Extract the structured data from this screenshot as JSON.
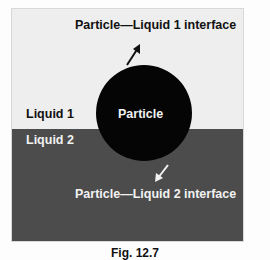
{
  "figure": {
    "colors": {
      "liquid1": "#eeeeee",
      "liquid2": "#4c4c4c",
      "particle": "#050505",
      "dark_text": "#111111",
      "light_text": "#f2f2f2"
    },
    "labels": {
      "interface1": "Particle—Liquid 1 interface",
      "interface2": "Particle—Liquid 2 interface",
      "liquid1": "Liquid 1",
      "liquid2": "Liquid 2",
      "particle": "Particle"
    },
    "arrows": {
      "interface1": "arrow-up-right",
      "interface2": "arrow-down-left"
    }
  },
  "caption": "Fig. 12.7"
}
